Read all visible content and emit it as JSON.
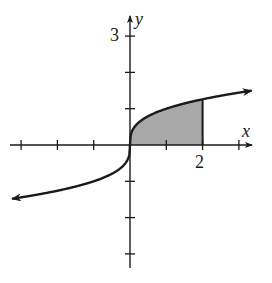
{
  "chart_data": {
    "type": "line",
    "title": "",
    "function": "y = cube root of x",
    "xlabel": "x",
    "ylabel": "y",
    "xlim": [
      -3.2,
      3.4
    ],
    "ylim": [
      -3.3,
      3.5
    ],
    "x_ticks": [
      -3,
      -2,
      -1,
      1,
      2,
      3
    ],
    "y_ticks": [
      -3,
      -2,
      -1,
      1,
      2,
      3
    ],
    "tick_labels": {
      "x": [
        {
          "value": 2,
          "label": "2"
        }
      ],
      "y": [
        {
          "value": 3,
          "label": "3"
        }
      ]
    },
    "shaded_region": {
      "from_x": 0,
      "to_x": 2,
      "between": "curve and x-axis",
      "color": "#a8a8a8"
    },
    "arrows": [
      "curve both ends",
      "positive x-axis",
      "positive y-axis"
    ],
    "grid": false
  },
  "labels": {
    "x_axis": "x",
    "y_axis": "y",
    "x_tick_2": "2",
    "y_tick_3": "3"
  },
  "colors": {
    "ink": "#1a1a1a",
    "shade": "#a8a8a8",
    "background": "#ffffff"
  }
}
